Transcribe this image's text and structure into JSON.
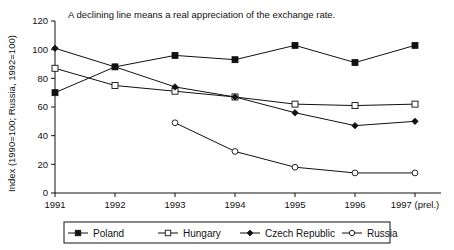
{
  "chart_data": {
    "type": "line",
    "title": "A  declining line means a real appreciation of the exchange rate.",
    "xlabel": "",
    "ylabel": "Index (1990=100; Russia, 1992=100)",
    "categories": [
      "1991",
      "1992",
      "1993",
      "1994",
      "1995",
      "1996",
      "1997 (prel.)"
    ],
    "x": [
      1991,
      1992,
      1993,
      1994,
      1995,
      1996,
      1997
    ],
    "ylim": [
      0,
      120
    ],
    "yticks": [
      0,
      20,
      40,
      60,
      80,
      100,
      120
    ],
    "ytick_labels": [
      "0",
      "20",
      "40",
      "60",
      "80",
      "100",
      "120"
    ],
    "grid": false,
    "legend_position": "bottom",
    "series": [
      {
        "name": "Poland",
        "marker": "filled-square",
        "values": [
          70,
          88,
          96,
          93,
          103,
          91,
          103
        ]
      },
      {
        "name": "Hungary",
        "marker": "open-square",
        "values": [
          87,
          75,
          71,
          67,
          62,
          61,
          62
        ]
      },
      {
        "name": "Czech Republic",
        "marker": "filled-diamond",
        "values": [
          101,
          88,
          74,
          67,
          56,
          47,
          50
        ]
      },
      {
        "name": "Russia",
        "marker": "open-circle",
        "values": [
          null,
          null,
          49,
          29,
          18,
          14,
          14
        ]
      }
    ],
    "colors": {
      "axis": "#111111",
      "line": "#111111",
      "background": "#ffffff"
    }
  },
  "legend": {
    "items": [
      {
        "label": "Poland",
        "marker": "filled-square"
      },
      {
        "label": "Hungary",
        "marker": "open-square"
      },
      {
        "label": "Czech Republic",
        "marker": "filled-diamond"
      },
      {
        "label": "Russia",
        "marker": "open-circle"
      }
    ]
  }
}
